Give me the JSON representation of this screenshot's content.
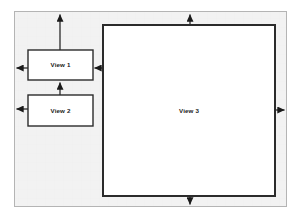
{
  "diagram": {
    "type": "block-arrow-diagram",
    "background_color": "#ffffff",
    "container": {
      "name": "outer-frame",
      "fill_color": "#f2f2f2",
      "border_color": "#b4b4b4",
      "x": 14,
      "y": 11,
      "width": 273,
      "height": 196
    },
    "boxes": [
      {
        "id": "view1",
        "label": "View 1",
        "x": 28,
        "y": 50,
        "width": 65,
        "height": 30,
        "fill_color": "#ffffff",
        "border_color": "#2b2b2b",
        "border_width": 1.4,
        "label_x": 60.5,
        "label_y": 67.5
      },
      {
        "id": "view2",
        "label": "View 2",
        "x": 28,
        "y": 95,
        "width": 65,
        "height": 31,
        "fill_color": "#ffffff",
        "border_color": "#2b2b2b",
        "border_width": 1.4,
        "label_x": 60.5,
        "label_y": 112.5
      },
      {
        "id": "view3",
        "label": "View 3",
        "x": 103,
        "y": 25,
        "width": 172,
        "height": 171,
        "fill_color": "#ffffff",
        "border_color": "#2b2b2b",
        "border_width": 2.0,
        "label_x": 189,
        "label_y": 111
      }
    ],
    "arrows": [
      {
        "id": "view1-to-top",
        "from": "view1",
        "to": "outer-frame-top",
        "direction": "up",
        "x1": 60,
        "y1": 50,
        "x2": 60,
        "y2": 13
      },
      {
        "id": "view1-to-left",
        "from": "view1",
        "to": "outer-frame-left",
        "direction": "left",
        "x1": 28,
        "y1": 68,
        "x2": 15,
        "y2": 68
      },
      {
        "id": "view2-to-left",
        "from": "view2",
        "to": "outer-frame-left",
        "direction": "left",
        "x1": 28,
        "y1": 109,
        "x2": 15,
        "y2": 109
      },
      {
        "id": "view2-to-view1",
        "from": "view2",
        "to": "view1",
        "direction": "up",
        "x1": 60,
        "y1": 95,
        "x2": 60,
        "y2": 81
      },
      {
        "id": "view3-to-view1",
        "from": "view3",
        "to": "view1",
        "direction": "left",
        "x1": 103,
        "y1": 68,
        "x2": 93,
        "y2": 68
      },
      {
        "id": "view3-to-top",
        "from": "view3",
        "to": "outer-frame-top",
        "direction": "up",
        "x1": 190,
        "y1": 25,
        "x2": 190,
        "y2": 13
      },
      {
        "id": "view3-to-right",
        "from": "view3",
        "to": "outer-frame-right",
        "direction": "right",
        "x1": 275,
        "y1": 110,
        "x2": 286,
        "y2": 110
      },
      {
        "id": "view3-to-bottom",
        "from": "view3",
        "to": "outer-frame-bottom",
        "direction": "down",
        "x1": 190,
        "y1": 196,
        "x2": 190,
        "y2": 206
      }
    ],
    "arrow_color": "#1a1a1a"
  }
}
